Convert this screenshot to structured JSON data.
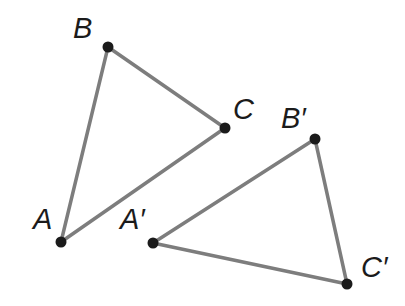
{
  "figure": {
    "kind": "geometry-diagram",
    "canvas": {
      "width": 405,
      "height": 306
    },
    "background_color": "#ffffff",
    "edge_color": "#7d7d7d",
    "edge_width": 3.5,
    "vertex_color": "#1b1b1b",
    "vertex_radius": 5.5,
    "label_color": "#1b1b1b",
    "label_font_size": 29
  },
  "shapes": [
    {
      "name": "triangle-abc",
      "vertex_keys": [
        "A",
        "B",
        "C"
      ],
      "closed": true
    },
    {
      "name": "triangle-abc-prime",
      "vertex_keys": [
        "A'",
        "B'",
        "C'"
      ],
      "closed": true
    }
  ],
  "points": [
    {
      "id": "A",
      "label": "A",
      "x": 61,
      "y": 242,
      "label_x": 33,
      "label_y": 229
    },
    {
      "id": "B",
      "label": "B",
      "x": 108,
      "y": 47,
      "label_x": 73,
      "label_y": 38
    },
    {
      "id": "C",
      "label": "C",
      "x": 225,
      "y": 128,
      "label_x": 233,
      "label_y": 119
    },
    {
      "id": "A'",
      "label": "A′",
      "x": 153,
      "y": 243,
      "label_x": 120,
      "label_y": 229
    },
    {
      "id": "B'",
      "label": "B′",
      "x": 315,
      "y": 139,
      "label_x": 281,
      "label_y": 128
    },
    {
      "id": "C'",
      "label": "C′",
      "x": 347,
      "y": 284,
      "label_x": 361,
      "label_y": 277
    }
  ],
  "edges": [
    {
      "name": "edge-ab",
      "from": "A",
      "to": "B",
      "x1": 61,
      "y1": 242,
      "x2": 108,
      "y2": 47
    },
    {
      "name": "edge-bc",
      "from": "B",
      "to": "C",
      "x1": 108,
      "y1": 47,
      "x2": 225,
      "y2": 128
    },
    {
      "name": "edge-ca",
      "from": "C",
      "to": "A",
      "x1": 225,
      "y1": 128,
      "x2": 61,
      "y2": 242
    },
    {
      "name": "edge-ab-prime",
      "from": "A'",
      "to": "B'",
      "x1": 153,
      "y1": 243,
      "x2": 315,
      "y2": 139
    },
    {
      "name": "edge-bc-prime",
      "from": "B'",
      "to": "C'",
      "x1": 315,
      "y1": 139,
      "x2": 347,
      "y2": 284
    },
    {
      "name": "edge-ca-prime",
      "from": "C'",
      "to": "A'",
      "x1": 347,
      "y1": 284,
      "x2": 153,
      "y2": 243
    }
  ]
}
